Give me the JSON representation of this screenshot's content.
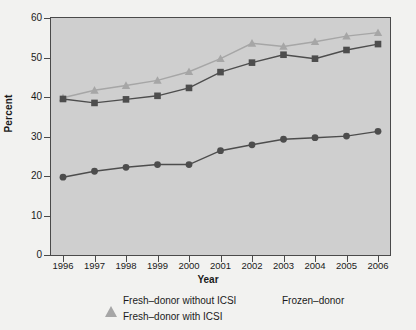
{
  "chart_data": {
    "type": "line",
    "title": "",
    "xlabel": "Year",
    "ylabel": "Percent",
    "categories": [
      "1996",
      "1997",
      "1998",
      "1999",
      "2000",
      "2001",
      "2002",
      "2003",
      "2004",
      "2005",
      "2006"
    ],
    "x": [
      1996,
      1997,
      1998,
      1999,
      2000,
      2001,
      2002,
      2003,
      2004,
      2005,
      2006
    ],
    "ylim": [
      0,
      60
    ],
    "yticks": [
      0,
      10,
      20,
      30,
      40,
      50,
      60
    ],
    "ytick_labels": [
      "0",
      "10",
      "20",
      "30",
      "40",
      "50",
      "60"
    ],
    "grid": false,
    "legend_position": "bottom",
    "series": [
      {
        "name": "Fresh–donor without ICSI",
        "marker": "triangle",
        "color": "#a6a6a6",
        "values": [
          39.8,
          41.7,
          42.9,
          44.2,
          46.4,
          49.7,
          53.6,
          52.8,
          54.0,
          55.4,
          56.3
        ]
      },
      {
        "name": "Fresh–donor with ICSI",
        "marker": "square",
        "color": "#4d4d4d",
        "values": [
          39.5,
          38.5,
          39.4,
          40.3,
          42.3,
          46.3,
          48.7,
          50.7,
          49.7,
          51.9,
          53.4
        ]
      },
      {
        "name": "Frozen–donor",
        "marker": "circle",
        "color": "#4d4d4d",
        "values": [
          19.7,
          21.2,
          22.2,
          22.9,
          22.9,
          26.4,
          27.9,
          29.3,
          29.7,
          30.1,
          31.3
        ]
      }
    ]
  },
  "legend": {
    "items": [
      {
        "label": "Fresh–donor without ICSI",
        "marker": "triangle-icon"
      },
      {
        "label": "Fresh–donor with ICSI",
        "marker": "square-icon"
      },
      {
        "label": "Frozen–donor",
        "marker": "circle-icon"
      }
    ]
  },
  "axes": {
    "y_title": "Percent",
    "x_title": "Year"
  },
  "colors": {
    "plot_background": "#cfcfcf",
    "figure_background": "#f2f2f0",
    "axis": "#4a4a4a",
    "light_series": "#a6a6a6",
    "dark_series": "#4d4d4d",
    "text": "#1a1a1a"
  }
}
